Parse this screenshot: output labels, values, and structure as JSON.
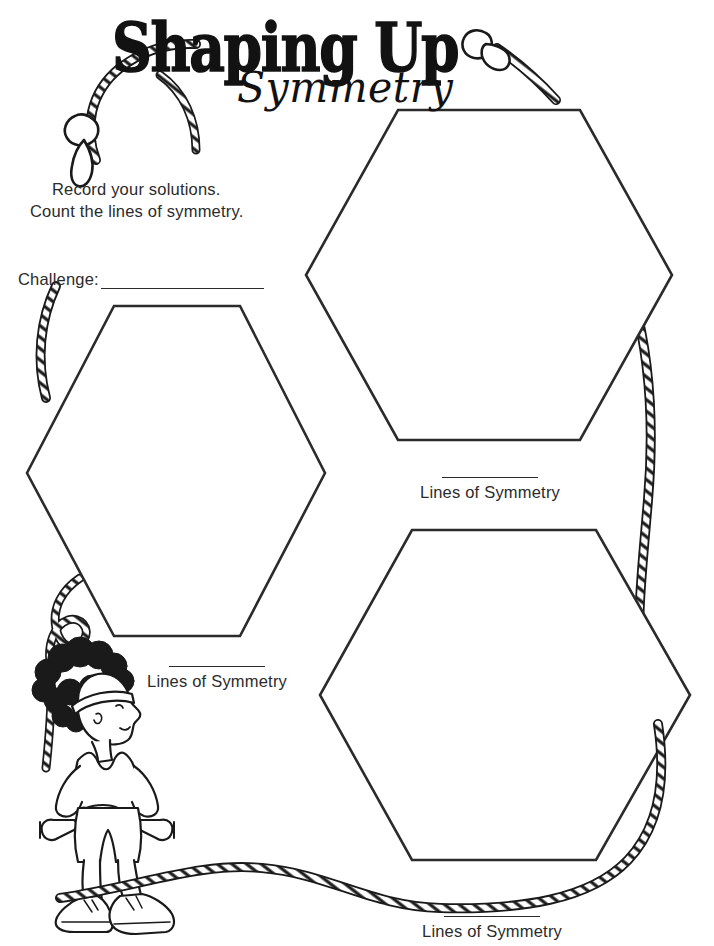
{
  "worksheet": {
    "title_main": "Shaping Up",
    "title_script": "Symmetry",
    "instructions": [
      "Record your solutions.",
      "Count the lines of symmetry."
    ],
    "challenge": {
      "label": "Challenge:",
      "value": ""
    },
    "shapes": [
      {
        "name": "hexagon-left",
        "sides": 6,
        "label": "Lines of Symmetry",
        "answer": ""
      },
      {
        "name": "hexagon-top-right",
        "sides": 6,
        "label": "Lines of Symmetry",
        "answer": ""
      },
      {
        "name": "hexagon-bottom-right",
        "sides": 6,
        "label": "Lines of Symmetry",
        "answer": ""
      }
    ],
    "decorations": [
      {
        "name": "jump-rope",
        "description": "braided jump rope with two handles framing the page"
      },
      {
        "name": "exercise-cartoon-figure",
        "description": "cartoon person with curly hair, headband, tank top, shorts, sneakers, hands on hips holding dumbbells"
      }
    ],
    "colors": {
      "ink": "#1a1a1a",
      "text": "#2b2b2b",
      "paper": "#ffffff"
    }
  }
}
